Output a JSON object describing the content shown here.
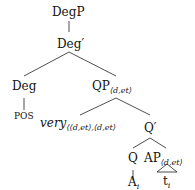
{
  "tree": {
    "root": "DegP",
    "degbar": "Deg′",
    "deg": "Deg",
    "pos": "POS",
    "qp": "QP",
    "qp_sub": "⟨d,et⟩",
    "very": "very",
    "very_sub": "⟨⟨d,et⟩,⟨d,et⟩",
    "qbar": "Q′",
    "q": "Q",
    "ap": "AP",
    "ap_sub": "⟨d,et⟩",
    "a": "A",
    "a_sub": "i",
    "t": "t",
    "t_sub": "i"
  }
}
